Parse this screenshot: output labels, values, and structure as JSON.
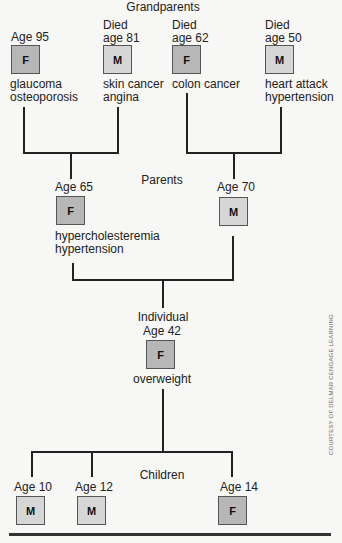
{
  "labels": {
    "grandparents": "Grandparents",
    "parents": "Parents",
    "individual": "Individual",
    "children": "Children",
    "credit": "COURTESY OF DELMAR CENGAGE LEARNING"
  },
  "colors": {
    "female_box": "#b7b7b7",
    "male_box": "#d6d6d6",
    "lines": "#222222"
  },
  "grandparents": [
    {
      "status": "",
      "age": "Age 95",
      "sex": "F",
      "conditions": [
        "glaucoma",
        "osteoporosis"
      ]
    },
    {
      "status": "Died",
      "age": "age 81",
      "sex": "M",
      "conditions": [
        "skin cancer",
        "angina"
      ]
    },
    {
      "status": "Died",
      "age": "age 62",
      "sex": "F",
      "conditions": [
        "colon cancer"
      ]
    },
    {
      "status": "Died",
      "age": "age 50",
      "sex": "M",
      "conditions": [
        "heart attack",
        "hypertension"
      ]
    }
  ],
  "parents": [
    {
      "age": "Age 65",
      "sex": "F",
      "conditions": [
        "hypercholesteremia",
        "hypertension"
      ]
    },
    {
      "age": "Age 70",
      "sex": "M",
      "conditions": []
    }
  ],
  "individual": {
    "age": "Age 42",
    "sex": "F",
    "conditions": [
      "overweight"
    ]
  },
  "children": [
    {
      "age": "Age 10",
      "sex": "M"
    },
    {
      "age": "Age 12",
      "sex": "M"
    },
    {
      "age": "Age 14",
      "sex": "F"
    }
  ]
}
